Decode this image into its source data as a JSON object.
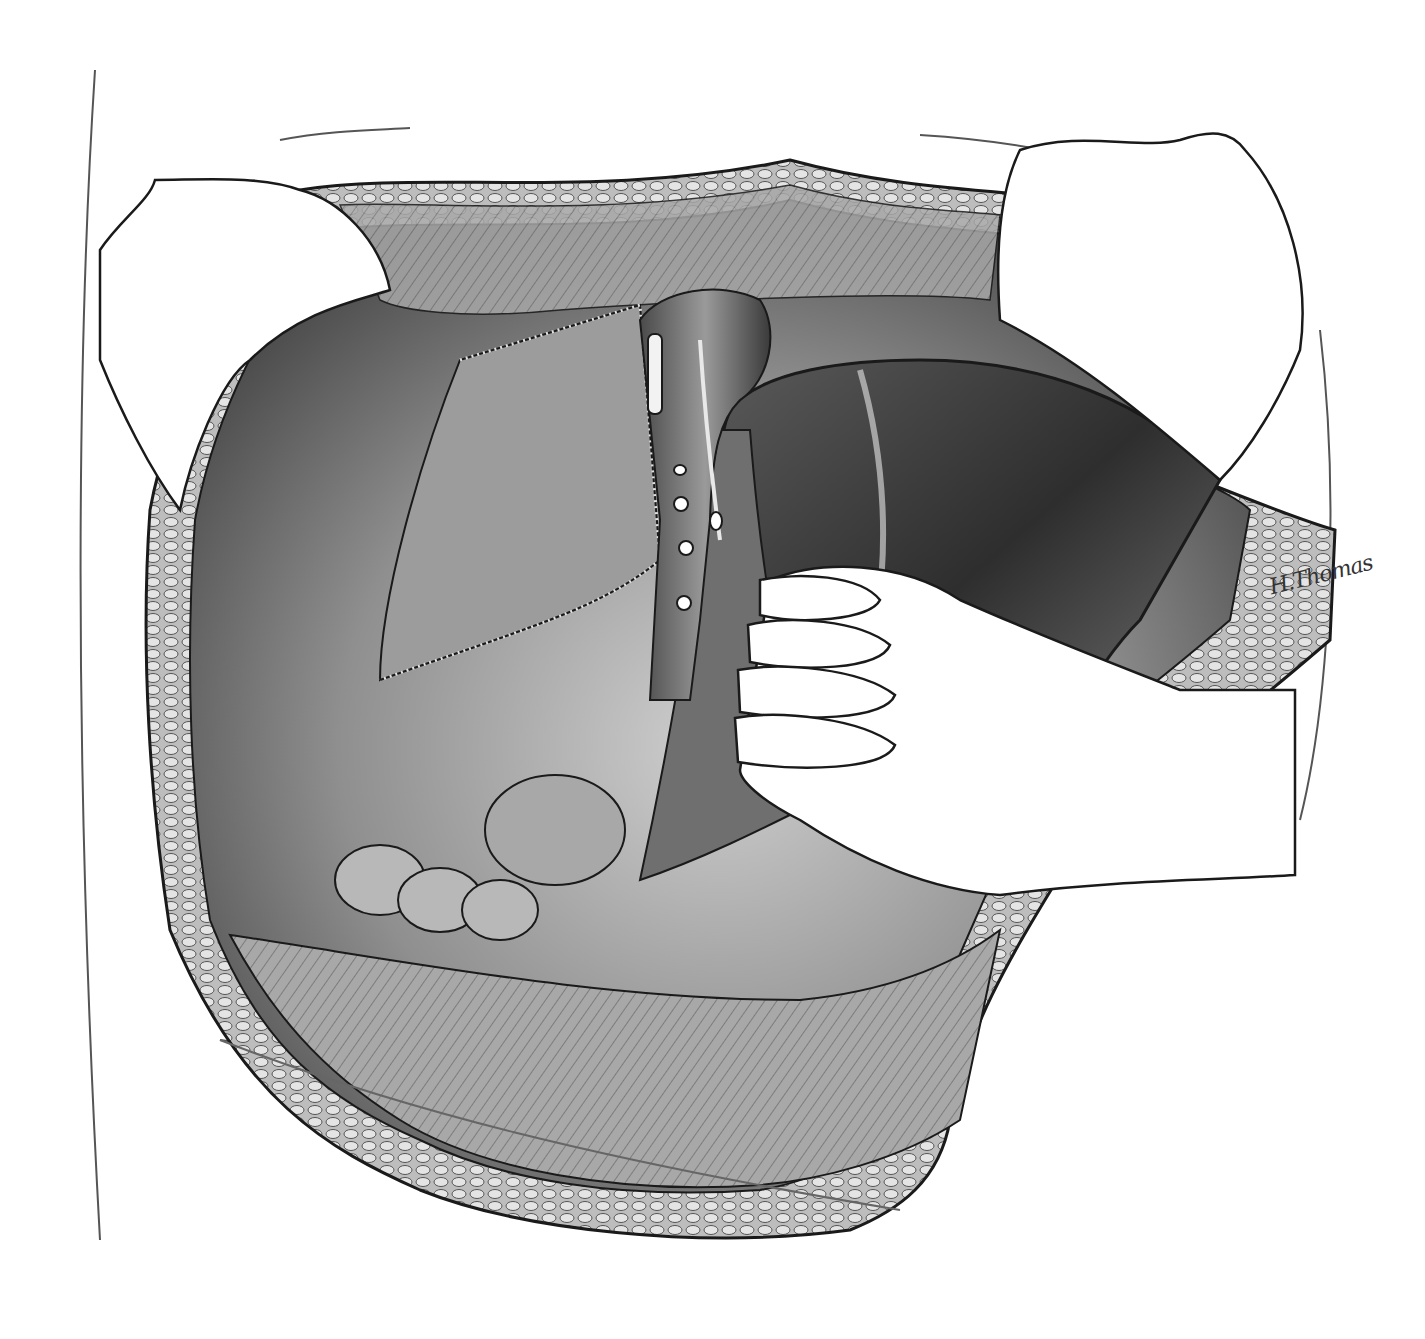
{
  "illustration": {
    "style": "grayscale surgical illustration",
    "signature": "H.Thomas",
    "palette": {
      "background": "#ffffff",
      "line": "#1a1a1a",
      "tissue_light": "#c8c8c8",
      "tissue_mid": "#8a8a8a",
      "tissue_dark": "#3a3a3a",
      "glove": "#ffffff"
    },
    "elements": [
      "abdominal-incision",
      "retractor-left",
      "retractor-right",
      "gloved-hand",
      "liver-lobe",
      "vessel-trunk",
      "ligated-branches",
      "bowel-loops",
      "fat-layer"
    ]
  }
}
